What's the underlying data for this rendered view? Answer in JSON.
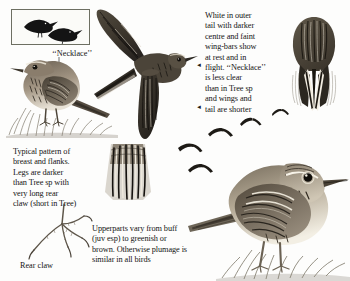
{
  "page": {
    "background_color": "#fdfdfc",
    "ink_color": "#1a1a1a"
  },
  "inset": {
    "name": "silhouette-inset-box",
    "border_color": "#6d6f62",
    "birds": [
      "pipit-silhouette-left",
      "pipit-silhouette-right"
    ]
  },
  "labels": {
    "necklace": "‘‘Necklace’’",
    "rear_claw": "Rear claw"
  },
  "captions": {
    "tail_and_wingbars": "White in outer\ntail with darker\ncentre and faint\nwing-bars show\nat rest and in\nflight. ‘‘Necklace’’\nis less clear\nthan in Tree sp\nand wings and\ntail are shorter",
    "breast_and_legs": "Typical pattern of\nbreast and flanks.\nLegs are darker\nthan Tree sp with\nvery long rear\nclaw (short in Tree)",
    "upperparts": "Upperparts vary from buff\n(juv esp) to greenish or\nbrown. Otherwise plumage is\nsimilar in all birds"
  },
  "arrows": {
    "glyph": "◄",
    "flight_line_marker": "◄",
    "tail_line_marker": "◄"
  },
  "figures": {
    "perched_left": "perched-pipit-in-grass",
    "flying_main": "flying-pipit-underwing",
    "rear_view": "pipit-rear-view-tail-pattern",
    "breast_panel": "breast-flank-pattern-panel",
    "perched_right": "perched-pipit-detailed",
    "foot": "rear-claw-foot-diagram",
    "distant_flock": "distant-flying-pipits"
  }
}
